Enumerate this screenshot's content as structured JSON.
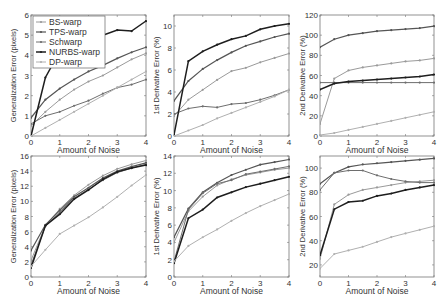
{
  "figure": {
    "x_ticks": [
      0,
      1,
      2,
      3,
      4
    ],
    "legend": [
      "BS-warp",
      "TPS-warp",
      "Schwarp",
      "NURBS-warp",
      "DP-warp"
    ]
  },
  "series_styles": {
    "BS-warp": {
      "color": "#9a9a9a",
      "width": 1.0
    },
    "TPS-warp": {
      "color": "#555555",
      "width": 1.2
    },
    "Schwarp": {
      "color": "#6e6e6e",
      "width": 1.0
    },
    "NURBS-warp": {
      "color": "#1e1e1e",
      "width": 1.5
    },
    "DP-warp": {
      "color": "#b0b0b0",
      "width": 1.0
    }
  },
  "chart_data": [
    {
      "type": "line",
      "title": "",
      "xlabel": "Amount of Noise",
      "ylabel": "Generalization Error (pixels)",
      "xlim": [
        0,
        4
      ],
      "ylim": [
        0,
        6
      ],
      "yticks": [
        0,
        1,
        2,
        3,
        4,
        5,
        6
      ],
      "legend_position": "upper left",
      "x": [
        0,
        0.5,
        1,
        1.5,
        2,
        2.5,
        3,
        3.5,
        4
      ],
      "series": [
        {
          "name": "BS-warp",
          "values": [
            0.5,
            1.2,
            1.8,
            2.3,
            2.7,
            3.0,
            3.4,
            3.8,
            4.1
          ]
        },
        {
          "name": "TPS-warp",
          "values": [
            0.9,
            1.8,
            2.35,
            2.8,
            3.2,
            3.5,
            3.85,
            4.15,
            4.4
          ]
        },
        {
          "name": "Schwarp",
          "values": [
            0.6,
            1.0,
            1.2,
            1.5,
            1.75,
            2.1,
            2.4,
            2.55,
            2.8
          ]
        },
        {
          "name": "NURBS-warp",
          "values": [
            0.0,
            2.9,
            4.2,
            4.7,
            4.9,
            5.0,
            5.25,
            5.2,
            5.7
          ]
        },
        {
          "name": "DP-warp",
          "values": [
            0.0,
            0.4,
            0.8,
            1.2,
            1.6,
            2.0,
            2.4,
            2.8,
            3.2
          ]
        }
      ]
    },
    {
      "type": "line",
      "title": "",
      "xlabel": "Amount of Noise",
      "ylabel": "1st Derivative Error (%)",
      "xlim": [
        0,
        4
      ],
      "ylim": [
        0,
        11
      ],
      "yticks": [
        0,
        2,
        4,
        6,
        8,
        10
      ],
      "x": [
        0,
        0.5,
        1,
        1.5,
        2,
        2.5,
        3,
        3.5,
        4
      ],
      "series": [
        {
          "name": "BS-warp",
          "values": [
            1.8,
            3.3,
            4.2,
            5.1,
            5.9,
            6.2,
            6.7,
            7.1,
            7.5
          ]
        },
        {
          "name": "TPS-warp",
          "values": [
            3.2,
            5.0,
            6.1,
            6.9,
            7.6,
            8.2,
            8.6,
            9.0,
            9.3
          ]
        },
        {
          "name": "Schwarp",
          "values": [
            2.0,
            2.5,
            2.7,
            2.6,
            2.9,
            3.0,
            3.3,
            3.7,
            4.2
          ]
        },
        {
          "name": "NURBS-warp",
          "values": [
            0.1,
            6.8,
            7.7,
            8.3,
            8.8,
            9.1,
            9.7,
            10.0,
            10.2
          ]
        },
        {
          "name": "DP-warp",
          "values": [
            0.0,
            0.5,
            1.0,
            1.6,
            2.1,
            2.6,
            3.1,
            3.6,
            4.2
          ]
        }
      ]
    },
    {
      "type": "line",
      "title": "",
      "xlabel": "Amount of Noise",
      "ylabel": "2nd Derivative Error (%)",
      "xlim": [
        0,
        4
      ],
      "ylim": [
        0,
        120
      ],
      "yticks": [
        0,
        20,
        40,
        60,
        80,
        100,
        120
      ],
      "x": [
        0,
        0.5,
        1,
        1.5,
        2,
        2.5,
        3,
        3.5,
        4
      ],
      "series": [
        {
          "name": "BS-warp",
          "values": [
            12,
            57,
            65,
            68,
            70,
            72,
            74,
            75,
            77
          ]
        },
        {
          "name": "TPS-warp",
          "values": [
            88,
            96,
            100,
            102,
            104,
            105,
            106,
            107,
            109
          ]
        },
        {
          "name": "Schwarp",
          "values": [
            53,
            53,
            53,
            53,
            53,
            53,
            53,
            53,
            53
          ]
        },
        {
          "name": "NURBS-warp",
          "values": [
            46,
            52,
            54,
            55,
            56,
            57,
            58,
            59,
            61
          ]
        },
        {
          "name": "DP-warp",
          "values": [
            1,
            3,
            6,
            9,
            12,
            15,
            18,
            21,
            24
          ]
        }
      ]
    },
    {
      "type": "line",
      "title": "",
      "xlabel": "Amount of Noise",
      "ylabel": "Generalization Error (pixels)",
      "xlim": [
        0,
        4
      ],
      "ylim": [
        0,
        16
      ],
      "yticks": [
        0,
        2,
        4,
        6,
        8,
        10,
        12,
        14,
        16
      ],
      "x": [
        0,
        0.5,
        1,
        1.5,
        2,
        2.5,
        3,
        3.5,
        4
      ],
      "series": [
        {
          "name": "BS-warp",
          "values": [
            2.2,
            6.8,
            9.0,
            10.8,
            12.2,
            13.4,
            14.3,
            14.9,
            15.4
          ]
        },
        {
          "name": "TPS-warp",
          "values": [
            3.5,
            6.9,
            8.8,
            10.6,
            11.8,
            13.1,
            14.0,
            14.6,
            15.1
          ]
        },
        {
          "name": "Schwarp",
          "values": [
            1.6,
            6.7,
            8.6,
            10.4,
            11.6,
            12.8,
            13.8,
            14.4,
            14.9
          ]
        },
        {
          "name": "NURBS-warp",
          "values": [
            1.2,
            6.8,
            8.3,
            10.3,
            11.5,
            12.9,
            13.9,
            14.4,
            14.8
          ]
        },
        {
          "name": "DP-warp",
          "values": [
            1.4,
            3.6,
            5.7,
            6.8,
            7.9,
            9.2,
            10.6,
            12.1,
            13.5
          ]
        }
      ]
    },
    {
      "type": "line",
      "title": "",
      "xlabel": "Amount of Noise",
      "ylabel": "1st Derivative Error (%)",
      "xlim": [
        0,
        4
      ],
      "ylim": [
        0,
        14
      ],
      "yticks": [
        0,
        2,
        4,
        6,
        8,
        10,
        12,
        14
      ],
      "x": [
        0,
        0.5,
        1,
        1.5,
        2,
        2.5,
        3,
        3.5,
        4
      ],
      "series": [
        {
          "name": "BS-warp",
          "values": [
            4.0,
            7.6,
            9.3,
            10.6,
            11.3,
            11.8,
            12.1,
            12.4,
            12.6
          ]
        },
        {
          "name": "TPS-warp",
          "values": [
            4.6,
            7.9,
            9.8,
            10.9,
            11.8,
            12.4,
            13.0,
            13.3,
            13.6
          ]
        },
        {
          "name": "Schwarp",
          "values": [
            1.8,
            7.8,
            9.7,
            10.8,
            11.2,
            11.9,
            12.2,
            12.5,
            12.8
          ]
        },
        {
          "name": "NURBS-warp",
          "values": [
            1.6,
            6.8,
            7.8,
            9.2,
            9.8,
            10.4,
            10.8,
            11.2,
            11.6
          ]
        },
        {
          "name": "DP-warp",
          "values": [
            1.8,
            3.6,
            4.6,
            5.5,
            6.5,
            7.4,
            8.2,
            8.9,
            9.6
          ]
        }
      ]
    },
    {
      "type": "line",
      "title": "",
      "xlabel": "Amount of Noise",
      "ylabel": "2nd Derivative Error (%)",
      "xlim": [
        0,
        4
      ],
      "ylim": [
        10,
        110
      ],
      "yticks": [
        20,
        40,
        60,
        80,
        100
      ],
      "x": [
        0,
        0.5,
        1,
        1.5,
        2,
        2.5,
        3,
        3.5,
        4
      ],
      "series": [
        {
          "name": "BS-warp",
          "values": [
            25,
            70,
            78,
            82,
            84,
            86,
            88,
            89,
            90
          ]
        },
        {
          "name": "TPS-warp",
          "values": [
            87,
            96,
            101,
            103,
            104,
            105,
            106,
            107,
            108
          ]
        },
        {
          "name": "Schwarp",
          "values": [
            82,
            96,
            98,
            98,
            94,
            91,
            89,
            88,
            88
          ]
        },
        {
          "name": "NURBS-warp",
          "values": [
            28,
            66,
            72,
            73,
            77,
            79,
            82,
            84,
            86
          ]
        },
        {
          "name": "DP-warp",
          "values": [
            17,
            29,
            32,
            35,
            39,
            43,
            46,
            49,
            52
          ]
        }
      ]
    }
  ]
}
